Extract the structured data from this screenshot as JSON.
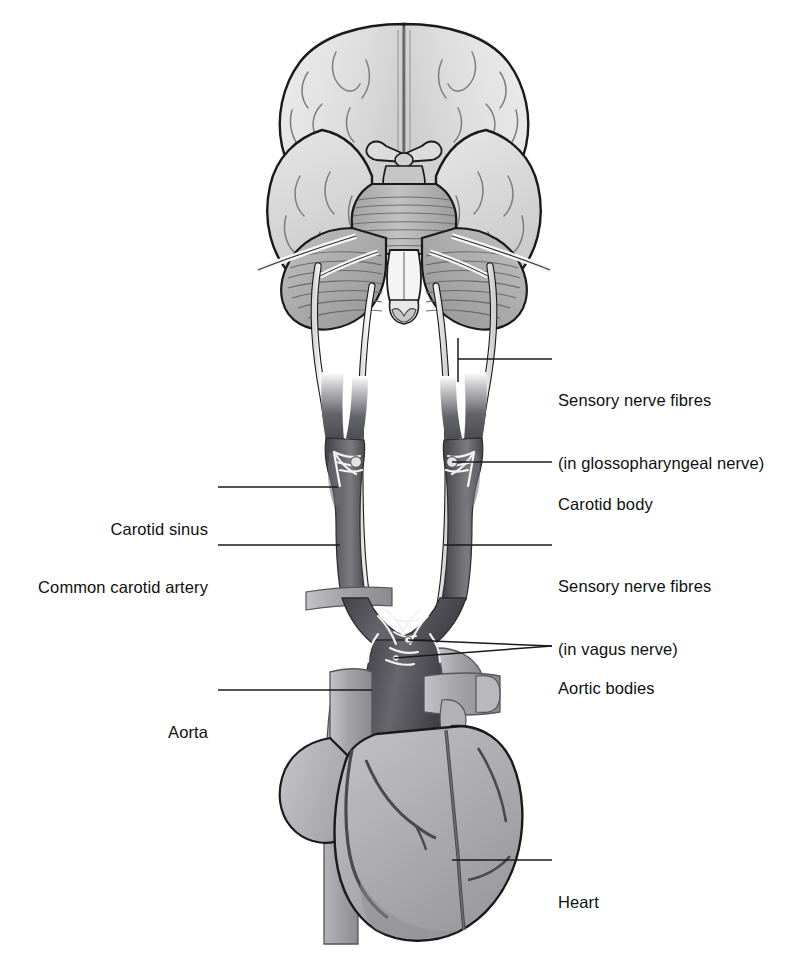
{
  "figure": {
    "view": "Inferior view of brain with carotid arteries, aortic arch and heart",
    "palette": {
      "background": "#ffffff",
      "outline": "#1a1a1a",
      "brain_fill": "#e2e2e2",
      "brainstem_fill": "#b5b5b5",
      "artery_dark": "#58585c",
      "artery_mid": "#8e8e92",
      "vessel_light": "#a8a8ac",
      "heart_fill": "#b0b0b4",
      "heart_shade": "#8c8c90",
      "nerve_fill": "#f2f2f2",
      "leader_line": "#1a1a1a",
      "text": "#101010"
    }
  },
  "labels": {
    "sensory_glossopharyngeal": {
      "line1": "Sensory nerve fibres",
      "line2": "(in glossopharyngeal nerve)",
      "side": "right"
    },
    "carotid_body": {
      "line1": "Carotid body",
      "side": "right"
    },
    "sensory_vagus": {
      "line1": "Sensory nerve fibres",
      "line2": "(in vagus nerve)",
      "side": "right"
    },
    "aortic_bodies": {
      "line1": "Aortic bodies",
      "side": "right"
    },
    "heart": {
      "line1": "Heart",
      "side": "right"
    },
    "carotid_sinus": {
      "line1": "Carotid sinus",
      "side": "left"
    },
    "common_carotid_artery": {
      "line1": "Common carotid artery",
      "side": "left"
    },
    "aorta": {
      "line1": "Aorta",
      "side": "left"
    }
  }
}
